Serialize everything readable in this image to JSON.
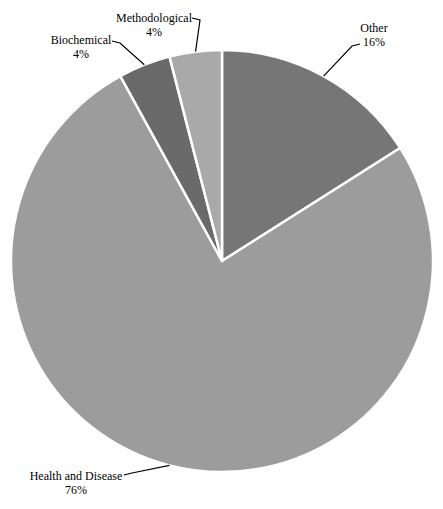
{
  "page": {
    "background_color": "#ffffff",
    "text_color": "#000000"
  },
  "chart_data": {
    "type": "pie",
    "title": "",
    "categories": [
      "Other",
      "Health and Disease",
      "Biochemical",
      "Methodological"
    ],
    "values": [
      16,
      76,
      4,
      4
    ],
    "unit": "%",
    "series": [
      {
        "name": "Other",
        "value": 16,
        "pct_label": "16%",
        "color": "#767676"
      },
      {
        "name": "Health and Disease",
        "value": 76,
        "pct_label": "76%",
        "color": "#9c9c9c"
      },
      {
        "name": "Biochemical",
        "value": 4,
        "pct_label": "4%",
        "color": "#6a6a6a"
      },
      {
        "name": "Methodological",
        "value": 4,
        "pct_label": "4%",
        "color": "#a9a9a9"
      }
    ],
    "layout": {
      "width": 443,
      "height": 509,
      "center_x": 222,
      "center_y": 261,
      "radius": 211,
      "start_angle_deg": 0,
      "direction": "clockwise",
      "slice_gap_color": "#ffffff",
      "slice_gap_width": 2.5,
      "leader_line_color": "#000000",
      "leader_line_width": 1.2,
      "legend": "none",
      "labels": [
        {
          "slice": "Methodological",
          "x": 154,
          "y": 11,
          "anchor_x": 192,
          "anchor_y": 18
        },
        {
          "slice": "Biochemical",
          "x": 81,
          "y": 33,
          "anchor_x": 112,
          "anchor_y": 41
        },
        {
          "slice": "Other",
          "x": 374,
          "y": 21,
          "anchor_x": 360,
          "anchor_y": 44
        },
        {
          "slice": "Health and Disease",
          "x": 76,
          "y": 469,
          "anchor_x": 124,
          "anchor_y": 475
        }
      ]
    }
  }
}
